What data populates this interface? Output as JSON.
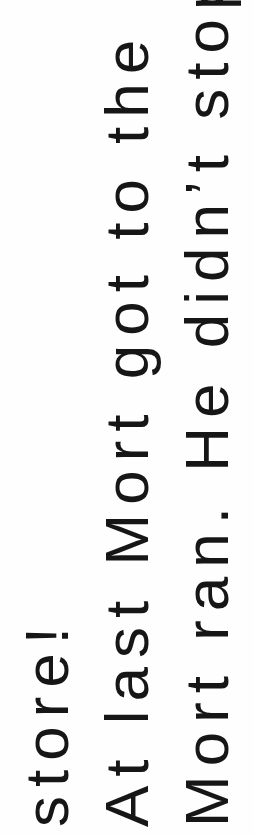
{
  "document": {
    "orientation": "rotated-90-ccw",
    "lines": [
      "Mort ran. He didn’t stop.",
      "At last Mort got to the",
      "store!"
    ],
    "text_color": "#161616",
    "background": "#fefefe"
  }
}
